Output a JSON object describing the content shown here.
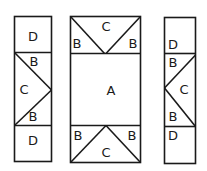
{
  "diagram": {
    "type": "quilt-block-piece-layout",
    "stroke_color": "#1a1a1a",
    "background": "#ffffff",
    "panels": [
      {
        "id": "left-strip",
        "pieces": [
          {
            "label": "D",
            "position": "top"
          },
          {
            "label": "B",
            "position": "upper-triangle"
          },
          {
            "label": "C",
            "position": "middle-triangle"
          },
          {
            "label": "B",
            "position": "lower-triangle"
          },
          {
            "label": "D",
            "position": "bottom"
          }
        ]
      },
      {
        "id": "center-panel",
        "pieces": [
          {
            "label": "B",
            "position": "top-left-triangle"
          },
          {
            "label": "C",
            "position": "top-middle-triangle"
          },
          {
            "label": "B",
            "position": "top-right-triangle"
          },
          {
            "label": "A",
            "position": "center-square"
          },
          {
            "label": "B",
            "position": "bottom-left-triangle"
          },
          {
            "label": "C",
            "position": "bottom-middle-triangle"
          },
          {
            "label": "B",
            "position": "bottom-right-triangle"
          }
        ]
      },
      {
        "id": "right-strip",
        "pieces": [
          {
            "label": "D",
            "position": "top"
          },
          {
            "label": "B",
            "position": "upper-triangle"
          },
          {
            "label": "C",
            "position": "middle-triangle"
          },
          {
            "label": "B",
            "position": "lower-triangle"
          },
          {
            "label": "D",
            "position": "bottom"
          }
        ]
      }
    ]
  }
}
